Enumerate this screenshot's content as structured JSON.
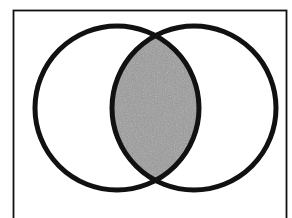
{
  "diagram": {
    "type": "venn",
    "sets": [
      {
        "id": "A",
        "label": ""
      },
      {
        "id": "B",
        "label": ""
      }
    ],
    "shaded_region": "A ∩ B",
    "colors": {
      "background": "#ffffff",
      "outline": "#111111",
      "shade": "#9a9a9a"
    }
  }
}
